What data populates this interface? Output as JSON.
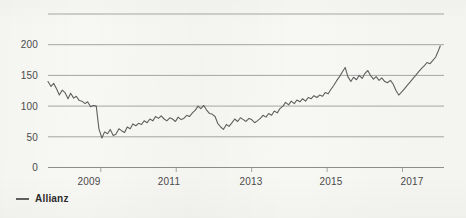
{
  "chart_data": {
    "type": "line",
    "title": "",
    "subtitle": "",
    "xlabel": "",
    "ylabel": "",
    "grid": true,
    "legend_position": "bottom-left",
    "xlim": [
      2007.6,
      2018.1
    ],
    "ylim": [
      0,
      250
    ],
    "y_ticks": [
      0,
      50,
      100,
      150,
      200
    ],
    "y_tick_labels": [
      "0",
      "50",
      "100",
      "150",
      "200"
    ],
    "y_gridlines": [
      0,
      50,
      100,
      150,
      200,
      250
    ],
    "x_ticks": [
      2009,
      2011,
      2013,
      2015,
      2017
    ],
    "x_tick_labels": [
      "2009",
      "2011",
      "2013",
      "2015",
      "2017"
    ],
    "series": [
      {
        "name": "Allianz",
        "color": "#5f5f5f",
        "x": [
          2007.6,
          2007.68,
          2007.75,
          2007.83,
          2007.9,
          2007.98,
          2008.05,
          2008.13,
          2008.2,
          2008.28,
          2008.35,
          2008.43,
          2008.5,
          2008.58,
          2008.65,
          2008.73,
          2008.8,
          2008.88,
          2008.95,
          2009.03,
          2009.1,
          2009.18,
          2009.25,
          2009.33,
          2009.4,
          2009.48,
          2009.55,
          2009.63,
          2009.7,
          2009.78,
          2009.85,
          2009.93,
          2010.0,
          2010.08,
          2010.15,
          2010.23,
          2010.3,
          2010.38,
          2010.45,
          2010.53,
          2010.6,
          2010.68,
          2010.75,
          2010.83,
          2010.9,
          2010.98,
          2011.05,
          2011.13,
          2011.2,
          2011.28,
          2011.35,
          2011.43,
          2011.5,
          2011.58,
          2011.65,
          2011.73,
          2011.8,
          2011.88,
          2011.95,
          2012.03,
          2012.1,
          2012.18,
          2012.25,
          2012.33,
          2012.4,
          2012.48,
          2012.55,
          2012.63,
          2012.7,
          2012.78,
          2012.85,
          2012.93,
          2013.0,
          2013.08,
          2013.15,
          2013.23,
          2013.3,
          2013.38,
          2013.45,
          2013.53,
          2013.6,
          2013.68,
          2013.75,
          2013.83,
          2013.9,
          2013.98,
          2014.05,
          2014.13,
          2014.2,
          2014.28,
          2014.35,
          2014.43,
          2014.5,
          2014.58,
          2014.65,
          2014.73,
          2014.8,
          2014.88,
          2014.95,
          2015.03,
          2015.1,
          2015.18,
          2015.25,
          2015.33,
          2015.4,
          2015.48,
          2015.55,
          2015.63,
          2015.7,
          2015.78,
          2015.85,
          2015.93,
          2016.0,
          2016.08,
          2016.15,
          2016.23,
          2016.3,
          2016.38,
          2016.45,
          2016.53,
          2016.6,
          2016.68,
          2016.75,
          2016.83,
          2016.9,
          2016.98,
          2017.05,
          2017.13,
          2017.2,
          2017.28,
          2017.35,
          2017.43,
          2017.5,
          2017.58,
          2017.65,
          2017.73,
          2017.8,
          2017.88,
          2017.95,
          2018.0
        ],
        "values": [
          140,
          132,
          137,
          128,
          118,
          126,
          122,
          112,
          121,
          113,
          116,
          109,
          108,
          104,
          107,
          99,
          101,
          100,
          63,
          48,
          58,
          55,
          62,
          52,
          54,
          63,
          60,
          57,
          66,
          63,
          71,
          68,
          72,
          70,
          76,
          73,
          79,
          76,
          83,
          80,
          84,
          79,
          76,
          81,
          79,
          75,
          82,
          78,
          80,
          85,
          83,
          89,
          93,
          100,
          96,
          101,
          94,
          88,
          87,
          83,
          72,
          66,
          62,
          70,
          67,
          73,
          79,
          75,
          81,
          78,
          75,
          80,
          78,
          73,
          76,
          80,
          85,
          82,
          88,
          85,
          92,
          89,
          96,
          100,
          106,
          102,
          108,
          104,
          110,
          107,
          112,
          108,
          114,
          112,
          117,
          114,
          118,
          116,
          122,
          120,
          127,
          134,
          141,
          148,
          155,
          163,
          148,
          140,
          147,
          143,
          150,
          145,
          153,
          158,
          150,
          144,
          148,
          142,
          146,
          140,
          138,
          142,
          136,
          125,
          118,
          123,
          128,
          134,
          139,
          145,
          150,
          156,
          161,
          166,
          171,
          169,
          174,
          180,
          190,
          198
        ]
      }
    ]
  },
  "legend": {
    "entries": [
      {
        "label": "Allianz",
        "marker": "line-marker",
        "color": "#5f5f5f"
      }
    ]
  },
  "axes": {
    "y_labels": [
      "200",
      "150",
      "100",
      "50",
      "0"
    ],
    "x_labels": [
      "2009",
      "2011",
      "2013",
      "2015",
      "2017"
    ]
  }
}
